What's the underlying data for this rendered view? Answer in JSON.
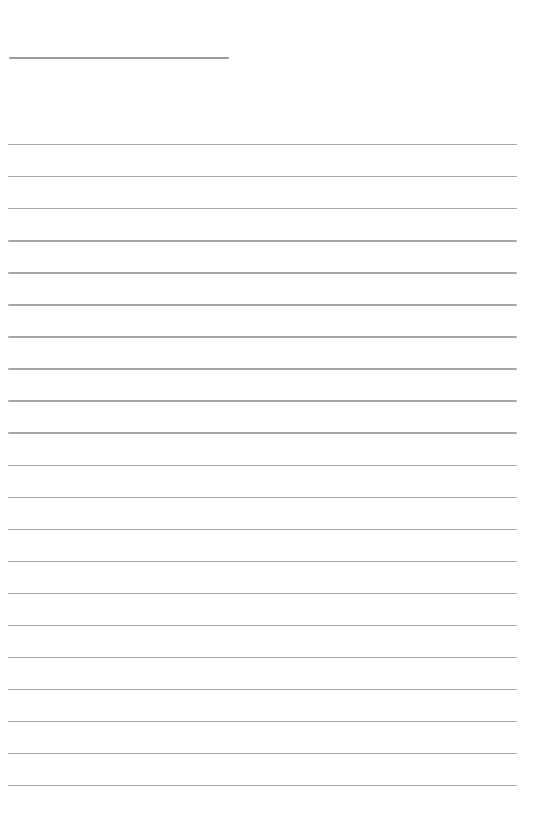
{
  "page": {
    "kind": "blank-lined-notes-page",
    "background_color": "#ffffff",
    "rule_color": "#a6a6a6",
    "top_rule_color": "#9b9b9b",
    "text_content": ""
  },
  "top_rule": {
    "description": "short horizontal rule near top-left (blank name/title underline)",
    "left_px": 9,
    "top_px": 57,
    "width_px": 220
  },
  "ruled_lines": {
    "description": "full-width horizontal writing lines, all blank",
    "count": 21,
    "left_px": 8,
    "width_px": 509,
    "first_top_px": 144,
    "spacing_px": 32.05
  }
}
